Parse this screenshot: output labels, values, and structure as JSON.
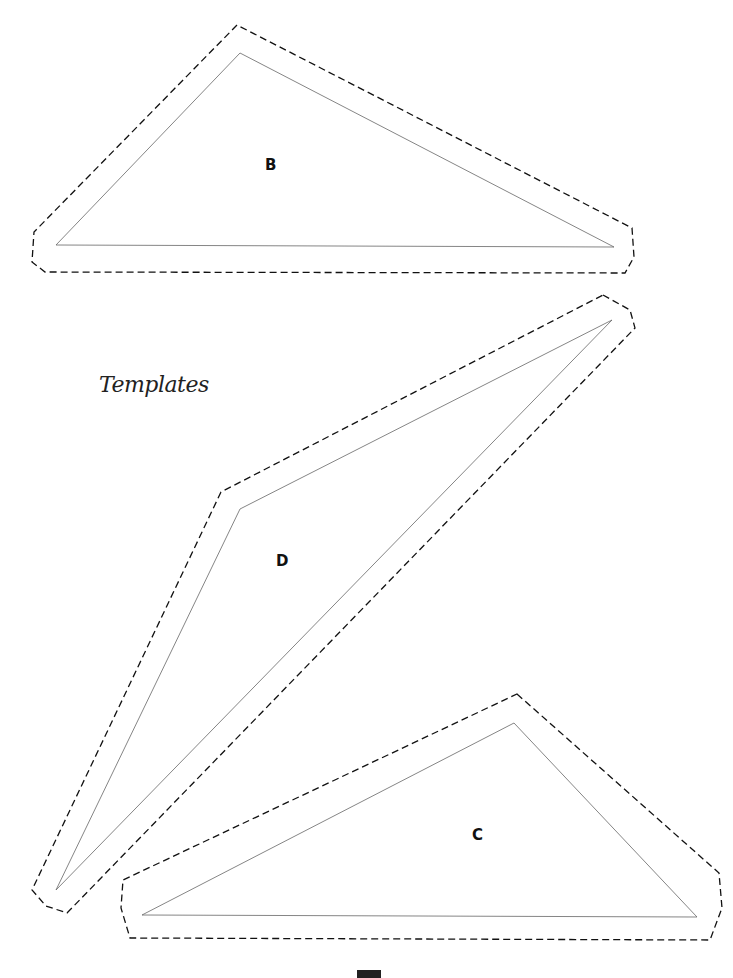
{
  "title": "Templates",
  "pieces": [
    {
      "label": "B"
    },
    {
      "label": "D"
    },
    {
      "label": "C"
    }
  ],
  "colors": {
    "line": "#555555",
    "dash": "#111111",
    "background": "#ffffff"
  }
}
